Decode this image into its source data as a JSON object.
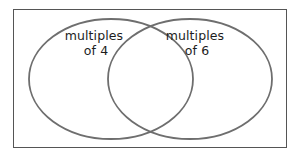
{
  "figure": {
    "type": "venn-diagram",
    "set_count": 2,
    "background_color": "#ffffff",
    "frame": {
      "border_color": "#555555",
      "border_width_px": 1,
      "fill_color": "#ffffff",
      "x": 13,
      "y": 9,
      "width": 274,
      "height": 139
    },
    "circle_stroke_color": "#6e6e6e",
    "circle_stroke_width_px": 1.8,
    "circle_fill": "none",
    "text_color": "#1d1d1d"
  },
  "sets": [
    {
      "id": "left-set",
      "label_line1": "multiples",
      "label_line2": "of 4",
      "label_full": "multiples of 4",
      "center_x": 111,
      "center_y": 79,
      "radius_x": 82,
      "radius_y": 60,
      "label_x": 96,
      "label_y": 40
    },
    {
      "id": "right-set",
      "label_line1": "multiples",
      "label_line2": "of 6",
      "label_full": "multiples of 6",
      "center_x": 190,
      "center_y": 79,
      "radius_x": 82,
      "radius_y": 60,
      "label_x": 197,
      "label_y": 40
    }
  ],
  "regions": {
    "left_only_label": "",
    "intersection_label": "",
    "right_only_label": "",
    "outside_label": ""
  }
}
